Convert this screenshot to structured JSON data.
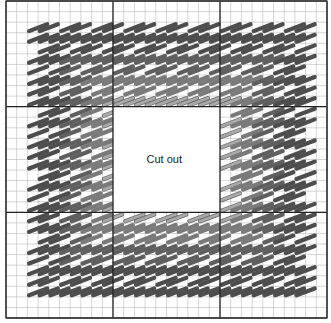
{
  "diagram": {
    "grid": {
      "left": 6,
      "top": 1,
      "right": 327,
      "bottom": 318,
      "cols": 30,
      "rows": 30,
      "major_every": 10,
      "minor_color": "#b8b8b8",
      "major_color": "#222222",
      "border_color": "#444444"
    },
    "cutout": {
      "label": "Cut out",
      "col_start": 10,
      "col_end": 20,
      "row_start": 10,
      "row_end": 20,
      "fill": "#ffffff"
    },
    "stitch_area": {
      "col_start": 2,
      "col_end": 28,
      "row_start": 2,
      "row_end": 28
    },
    "rings": [
      {
        "name": "outer",
        "depth_from": 0,
        "depth_to": 3,
        "color": "#4d4d4d"
      },
      {
        "name": "middle-dark",
        "depth_from": 3,
        "depth_to": 5,
        "color": "#5f5f5f"
      },
      {
        "name": "middle",
        "depth_from": 5,
        "depth_to": 7,
        "color": "#7a7a7a"
      },
      {
        "name": "inner-light",
        "depth_from": 7,
        "depth_to": 8,
        "color": "#a9a9a9"
      }
    ]
  }
}
